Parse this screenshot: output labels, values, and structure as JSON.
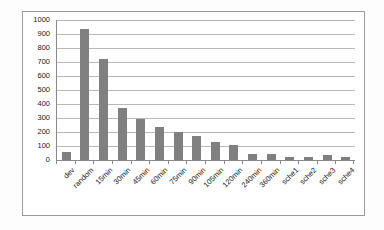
{
  "chart_data": {
    "type": "bar",
    "title": "",
    "subtitle": "",
    "xlabel": "",
    "ylabel": "",
    "ylim": [
      0,
      1000
    ],
    "ytick_step": 100,
    "yticks": [
      1000,
      900,
      800,
      700,
      600,
      500,
      400,
      300,
      200,
      100,
      0
    ],
    "grid": true,
    "legend": false,
    "legend_position": "none",
    "bar_color": "#808080",
    "gridline_color": "#b9b9b9",
    "axis_color": "#8a8a8a",
    "frame_color": "#9a9a9a",
    "background_color": "#ffffff",
    "categories": [
      "dev",
      "random",
      "15min",
      "30min",
      "45min",
      "60min",
      "75min",
      "90min",
      "105min",
      "120min",
      "240min",
      "360min",
      "sche1",
      "sche2",
      "sche3",
      "sche4"
    ],
    "values": [
      60,
      937,
      720,
      370,
      292,
      237,
      202,
      170,
      130,
      110,
      42,
      42,
      24,
      24,
      34,
      24
    ]
  }
}
